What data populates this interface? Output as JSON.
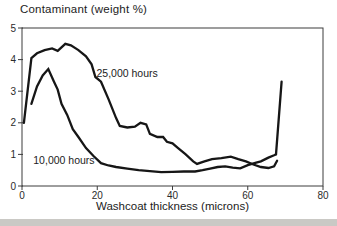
{
  "figure": {
    "title": "Contaminant (weight %)",
    "xlabel": "Washcoat thickness (microns)",
    "colors": {
      "line": "#161616",
      "axis": "#3c3c3c",
      "text": "#1c1c1c",
      "background": "#ffffff",
      "bottom_strip": "#cac9c5"
    }
  },
  "chart_data": {
    "type": "line",
    "title": "Contaminant (weight %)",
    "xlabel": "Washcoat thickness (microns)",
    "ylabel": "Contaminant (weight %)",
    "xlim": [
      0,
      80
    ],
    "ylim": [
      0,
      5
    ],
    "x_ticks": [
      0,
      20,
      40,
      60,
      80
    ],
    "y_ticks": [
      0,
      1,
      2,
      3,
      4,
      5
    ],
    "grid": false,
    "legend_position": "inline-annotations",
    "series": [
      {
        "name": "25,000 hours",
        "points": [
          [
            0.5,
            2.0
          ],
          [
            2.5,
            4.05
          ],
          [
            4,
            4.2
          ],
          [
            6,
            4.3
          ],
          [
            8,
            4.35
          ],
          [
            9.5,
            4.28
          ],
          [
            11.5,
            4.5
          ],
          [
            13,
            4.45
          ],
          [
            15,
            4.3
          ],
          [
            17,
            4.1
          ],
          [
            18.5,
            3.85
          ],
          [
            19.5,
            3.45
          ],
          [
            21,
            3.3
          ],
          [
            23,
            2.75
          ],
          [
            25,
            2.15
          ],
          [
            26,
            1.9
          ],
          [
            28,
            1.85
          ],
          [
            30,
            1.88
          ],
          [
            31.5,
            2.0
          ],
          [
            33,
            1.95
          ],
          [
            34,
            1.65
          ],
          [
            36,
            1.55
          ],
          [
            37.5,
            1.55
          ],
          [
            38.5,
            1.4
          ],
          [
            40,
            1.35
          ],
          [
            41.5,
            1.2
          ],
          [
            43.5,
            1.0
          ],
          [
            45.5,
            0.78
          ],
          [
            46.5,
            0.7
          ],
          [
            48.5,
            0.78
          ],
          [
            50.5,
            0.85
          ],
          [
            53,
            0.88
          ],
          [
            55.5,
            0.93
          ],
          [
            57.5,
            0.85
          ],
          [
            59.5,
            0.78
          ],
          [
            61.5,
            0.68
          ],
          [
            63.5,
            0.6
          ],
          [
            65.5,
            0.57
          ],
          [
            67,
            0.62
          ],
          [
            67.8,
            0.8
          ]
        ]
      },
      {
        "name": "10,000 hours",
        "points": [
          [
            2.5,
            2.6
          ],
          [
            4,
            3.15
          ],
          [
            5.5,
            3.5
          ],
          [
            7,
            3.7
          ],
          [
            8.5,
            3.3
          ],
          [
            9.5,
            3.05
          ],
          [
            10.5,
            2.6
          ],
          [
            12,
            2.25
          ],
          [
            13.5,
            1.8
          ],
          [
            15,
            1.55
          ],
          [
            17,
            1.2
          ],
          [
            19,
            0.95
          ],
          [
            21,
            0.72
          ],
          [
            23,
            0.65
          ],
          [
            25,
            0.6
          ],
          [
            28,
            0.55
          ],
          [
            31,
            0.5
          ],
          [
            34,
            0.47
          ],
          [
            37,
            0.44
          ],
          [
            40,
            0.45
          ],
          [
            43,
            0.46
          ],
          [
            46,
            0.46
          ],
          [
            48,
            0.5
          ],
          [
            50,
            0.55
          ],
          [
            52,
            0.6
          ],
          [
            54,
            0.62
          ],
          [
            56,
            0.58
          ],
          [
            58,
            0.56
          ],
          [
            60,
            0.66
          ],
          [
            62,
            0.73
          ],
          [
            63.5,
            0.78
          ],
          [
            65.5,
            0.9
          ],
          [
            67,
            0.97
          ],
          [
            67.5,
            1.0
          ],
          [
            69,
            3.3
          ]
        ]
      }
    ],
    "annotations": [
      {
        "text": "25,000 hours",
        "x": 19.8,
        "y": 3.55,
        "anchor": "start"
      },
      {
        "text": "10,000 hours",
        "x": 3.0,
        "y": 0.82,
        "anchor": "start"
      }
    ]
  }
}
